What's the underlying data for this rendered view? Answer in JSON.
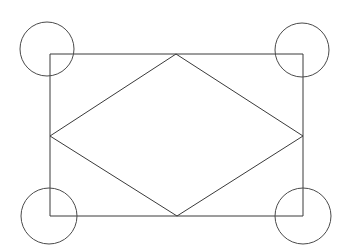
{
  "figure": {
    "canvas": {
      "width": 346,
      "height": 251,
      "background": "#ffffff"
    },
    "stroke_color": "#3a3a3a",
    "circle_stroke_color": "#4a4a4a",
    "stroke_width": 1,
    "rectangle": {
      "name": "outer-rectangle",
      "x": 50,
      "y": 54,
      "width": 253,
      "height": 162,
      "points": "50,54 303,54 303,216 50,216"
    },
    "rhombus": {
      "name": "inscribed-rhombus",
      "points": "176,54 303,136 177,216 50,136",
      "vertices": [
        {
          "name": "top-vertex",
          "x": 176,
          "y": 54
        },
        {
          "name": "right-vertex",
          "x": 303,
          "y": 136
        },
        {
          "name": "bottom-vertex",
          "x": 177,
          "y": 216
        },
        {
          "name": "left-vertex",
          "x": 50,
          "y": 136
        }
      ]
    },
    "circles": [
      {
        "name": "circle-top-left",
        "cx": 47,
        "cy": 49,
        "r": 27
      },
      {
        "name": "circle-top-right",
        "cx": 302,
        "cy": 50,
        "r": 27
      },
      {
        "name": "circle-bottom-left",
        "cx": 49,
        "cy": 216,
        "r": 28
      },
      {
        "name": "circle-bottom-right",
        "cx": 303,
        "cy": 216,
        "r": 28
      }
    ]
  }
}
